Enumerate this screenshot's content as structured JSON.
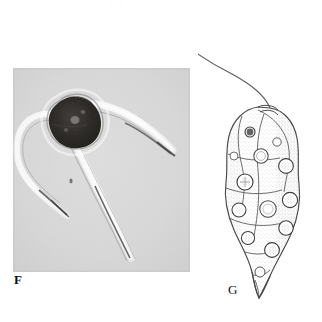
{
  "plate": {
    "background_color": "#ffffff",
    "caption_remnant": "· · ·"
  },
  "panels": [
    {
      "id": "F",
      "label": "F",
      "type": "photomicrograph",
      "technique": "phase contrast light micrograph",
      "subject": "three-horned armoured dinoflagellate cell (Ceratium-like)",
      "frame": {
        "x": 13,
        "y": 68,
        "width": 177,
        "height": 204
      },
      "background_color": "#d9d9d9",
      "cell_body_color": "#2b2b2b",
      "features": {
        "body_description": "dark roughly pentagonal theca near upper-left of frame",
        "horn_count": 3,
        "horns": [
          {
            "name": "apical-horn",
            "direction": "upper-right",
            "appearance": "bright tapering spine"
          },
          {
            "name": "left-antapical-horn",
            "direction": "lower-left, recurved",
            "appearance": "bright curved spine"
          },
          {
            "name": "right-antapical-horn",
            "direction": "lower-right",
            "appearance": "long bright straight spine"
          }
        ]
      }
    },
    {
      "id": "G",
      "label": "G",
      "type": "line-drawing",
      "technique": "stippled ink illustration",
      "subject": "elongate flagellate cell with single long anterior flagellum",
      "frame": {
        "x": 198,
        "y": 4,
        "width": 122,
        "height": 300
      },
      "ink_color": "#3a3a3a",
      "features": {
        "flagellum": {
          "origin": "apex of cell",
          "length": "approximately equal to cell body",
          "path": "S-curve sweeping up and to the left"
        },
        "body_shape": "pyriform / elongate, tapering to a pointed posterior tail",
        "inclusion_count": 13,
        "inclusion_description": "circular vacuoles and chromatophores distributed through the cytoplasm",
        "surface_texture": "fine stippling with longitudinal striae"
      }
    }
  ]
}
